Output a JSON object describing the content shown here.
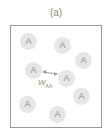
{
  "panel_label": "(a)",
  "atoms": [
    {
      "label": "A",
      "x": 20,
      "y": 33
    },
    {
      "label": "A",
      "x": 54,
      "y": 37
    },
    {
      "label": "A",
      "x": 75,
      "y": 52
    },
    {
      "label": "A",
      "x": 25,
      "y": 62
    },
    {
      "label": "A",
      "x": 58,
      "y": 70
    },
    {
      "label": "A",
      "x": 73,
      "y": 88
    },
    {
      "label": "A",
      "x": 19,
      "y": 96
    },
    {
      "label": "A",
      "x": 49,
      "y": 106
    }
  ],
  "interaction": {
    "symbol": "W",
    "subscript": "AA"
  },
  "colors": {
    "atom_fill": "#e6e6e6",
    "text": "#8c8c8c",
    "border": "#9a9a9a",
    "arrow": "#a0a0a0"
  }
}
